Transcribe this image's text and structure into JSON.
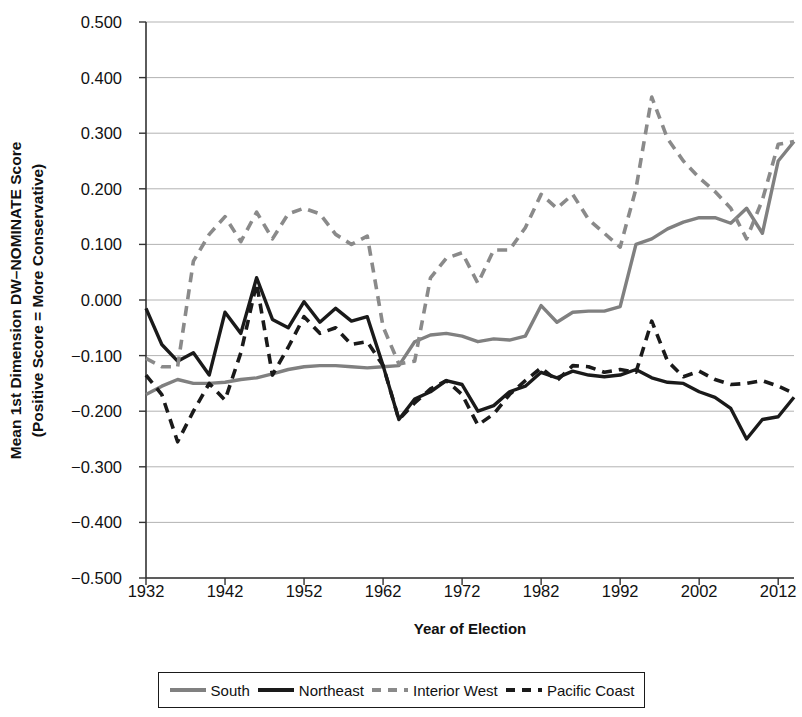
{
  "axes": {
    "ylabel_line1": "Mean 1st Dimension DW–NOMINATE Score",
    "ylabel_line2": "(Positive Score = More Conservative)",
    "xlabel": "Year of Election",
    "yticks": [
      "0.500",
      "0.400",
      "0.300",
      "0.200",
      "0.100",
      "0.000",
      "−0.100",
      "−0.200",
      "−0.300",
      "−0.400",
      "−0.500"
    ],
    "xticks": [
      "1932",
      "1942",
      "1952",
      "1962",
      "1972",
      "1982",
      "1992",
      "2002",
      "2012"
    ]
  },
  "legend": {
    "items": [
      {
        "label": "South",
        "swatch": "solid-gray-line",
        "color": "#808080",
        "dash": "none"
      },
      {
        "label": "Northeast",
        "swatch": "solid-black-line",
        "color": "#1a1a1a",
        "dash": "none"
      },
      {
        "label": "Interior West",
        "swatch": "dashed-gray-line",
        "color": "#8a8a8a",
        "dash": "10,7"
      },
      {
        "label": "Pacific Coast",
        "swatch": "dashed-black-line",
        "color": "#1a1a1a",
        "dash": "10,7"
      }
    ]
  },
  "chart_data": {
    "type": "line",
    "title": "",
    "xlabel": "Year of Election",
    "ylabel": "Mean 1st Dimension DW–NOMINATE Score (Positive Score = More Conservative)",
    "xlim": [
      1932,
      2014
    ],
    "ylim": [
      -0.5,
      0.5
    ],
    "ytick_values": [
      0.5,
      0.4,
      0.3,
      0.2,
      0.1,
      0.0,
      -0.1,
      -0.2,
      -0.3,
      -0.4,
      -0.5
    ],
    "xtick_values": [
      1932,
      1942,
      1952,
      1962,
      1972,
      1982,
      1992,
      2002,
      2012
    ],
    "grid": "horizontal",
    "legend_position": "below",
    "x": [
      1932,
      1934,
      1936,
      1938,
      1940,
      1942,
      1944,
      1946,
      1948,
      1950,
      1952,
      1954,
      1956,
      1958,
      1960,
      1962,
      1964,
      1966,
      1968,
      1970,
      1972,
      1974,
      1976,
      1978,
      1980,
      1982,
      1984,
      1986,
      1988,
      1990,
      1992,
      1994,
      1996,
      1998,
      2000,
      2002,
      2004,
      2006,
      2008,
      2010,
      2012,
      2014
    ],
    "series": [
      {
        "name": "South",
        "color": "#808080",
        "dash": "none",
        "values": [
          -0.17,
          -0.155,
          -0.143,
          -0.15,
          -0.15,
          -0.148,
          -0.143,
          -0.14,
          -0.133,
          -0.125,
          -0.12,
          -0.118,
          -0.118,
          -0.12,
          -0.122,
          -0.12,
          -0.118,
          -0.075,
          -0.063,
          -0.06,
          -0.065,
          -0.075,
          -0.07,
          -0.072,
          -0.065,
          -0.01,
          -0.04,
          -0.022,
          -0.02,
          -0.02,
          -0.012,
          0.1,
          0.11,
          0.128,
          0.14,
          0.148,
          0.148,
          0.138,
          0.165,
          0.12,
          0.25,
          0.285
        ]
      },
      {
        "name": "Northeast",
        "color": "#1a1a1a",
        "dash": "none",
        "values": [
          -0.015,
          -0.08,
          -0.11,
          -0.095,
          -0.135,
          -0.022,
          -0.06,
          0.04,
          -0.035,
          -0.05,
          -0.003,
          -0.04,
          -0.015,
          -0.038,
          -0.03,
          -0.118,
          -0.215,
          -0.178,
          -0.165,
          -0.145,
          -0.152,
          -0.2,
          -0.19,
          -0.165,
          -0.155,
          -0.13,
          -0.14,
          -0.128,
          -0.135,
          -0.138,
          -0.135,
          -0.125,
          -0.14,
          -0.148,
          -0.15,
          -0.165,
          -0.175,
          -0.195,
          -0.25,
          -0.215,
          -0.21,
          -0.175
        ]
      },
      {
        "name": "Interior West",
        "color": "#8a8a8a",
        "dash": "10,7",
        "values": [
          -0.105,
          -0.12,
          -0.12,
          0.07,
          0.118,
          0.15,
          0.105,
          0.158,
          0.11,
          0.155,
          0.165,
          0.155,
          0.118,
          0.1,
          0.115,
          -0.048,
          -0.115,
          -0.11,
          0.04,
          0.075,
          0.085,
          0.03,
          0.09,
          0.09,
          0.13,
          0.19,
          0.165,
          0.19,
          0.145,
          0.12,
          0.095,
          0.2,
          0.365,
          0.29,
          0.25,
          0.22,
          0.195,
          0.165,
          0.11,
          0.18,
          0.28,
          0.285
        ]
      },
      {
        "name": "Pacific Coast",
        "color": "#1a1a1a",
        "dash": "10,7",
        "values": [
          -0.135,
          -0.17,
          -0.255,
          -0.2,
          -0.15,
          -0.18,
          -0.095,
          0.03,
          -0.135,
          -0.085,
          -0.03,
          -0.06,
          -0.05,
          -0.08,
          -0.075,
          -0.118,
          -0.215,
          -0.185,
          -0.16,
          -0.145,
          -0.17,
          -0.225,
          -0.205,
          -0.17,
          -0.145,
          -0.122,
          -0.145,
          -0.118,
          -0.12,
          -0.13,
          -0.125,
          -0.13,
          -0.038,
          -0.11,
          -0.138,
          -0.128,
          -0.143,
          -0.152,
          -0.15,
          -0.145,
          -0.155,
          -0.168
        ]
      }
    ]
  }
}
